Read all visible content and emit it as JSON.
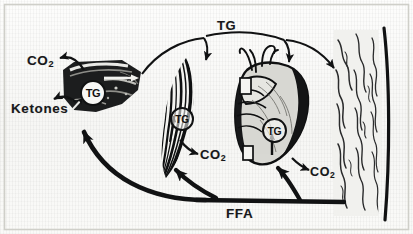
{
  "figure": {
    "background_color": "#fbfbfa",
    "ink_color": "#111213",
    "border": true
  },
  "labels": {
    "co2_liver": "CO",
    "co2_liver_sub": "2",
    "ketones": "Ketones",
    "tg_top": "TG",
    "co2_muscle": "CO",
    "co2_muscle_sub": "2",
    "co2_heart": "CO",
    "co2_heart_sub": "2",
    "ffa": "FFA"
  },
  "organs": [
    {
      "name": "liver",
      "tg_label": "TG",
      "x": 62,
      "y": 62,
      "w": 80,
      "h": 52
    },
    {
      "name": "muscle",
      "tg_label": "TG",
      "x": 158,
      "y": 58,
      "w": 46,
      "h": 120
    },
    {
      "name": "heart",
      "tg_label": "TG",
      "x": 232,
      "y": 58,
      "w": 78,
      "h": 112
    },
    {
      "name": "adipose",
      "tg_label": "",
      "x": 330,
      "y": 28,
      "w": 56,
      "h": 190
    }
  ],
  "arrows": [
    {
      "name": "liver-to-co2",
      "from": "liver",
      "to": "co2_liver",
      "style": "thin-curved"
    },
    {
      "name": "liver-to-ketones",
      "from": "liver",
      "to": "ketones",
      "style": "thin-curved"
    },
    {
      "name": "tg-liver-to-muscle",
      "from": "liver",
      "to": "muscle",
      "style": "thin-arc",
      "label": "TG"
    },
    {
      "name": "tg-to-heart",
      "from": "tg_top",
      "to": "heart",
      "style": "thin-arc",
      "label": "TG"
    },
    {
      "name": "tg-to-adipose",
      "from": "heart",
      "to": "adipose",
      "style": "thin-arc",
      "label": "TG"
    },
    {
      "name": "muscle-to-co2",
      "from": "muscle",
      "to": "co2_muscle",
      "style": "thin-curved"
    },
    {
      "name": "heart-to-co2",
      "from": "heart",
      "to": "co2_heart",
      "style": "thin-curved"
    },
    {
      "name": "ffa-to-liver",
      "from": "ffa",
      "to": "liver",
      "style": "thick-arc"
    },
    {
      "name": "ffa-to-muscle",
      "from": "ffa",
      "to": "muscle",
      "style": "thick-arc"
    },
    {
      "name": "ffa-to-heart",
      "from": "ffa",
      "to": "heart",
      "style": "thick-arc"
    },
    {
      "name": "ffa-trunk",
      "from": "adipose",
      "to": "ffa",
      "style": "thick-line"
    }
  ]
}
